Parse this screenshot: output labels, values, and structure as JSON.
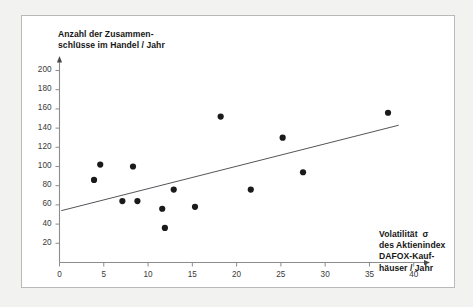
{
  "chart_data": {
    "type": "scatter",
    "title": "",
    "ylabel": "Anzahl der Zusammen-\nschlüsse im Handel / Jahr",
    "xlabel": "Volatilität  σ\ndes Aktienindex\nDAFOX-Kauf-\nhäuser / Jahr",
    "xlim": [
      0,
      41.5
    ],
    "ylim": [
      0,
      212
    ],
    "xticks": [
      0,
      5,
      10,
      15,
      20,
      25,
      30,
      35,
      40
    ],
    "yticks": [
      20,
      40,
      60,
      80,
      100,
      120,
      140,
      160,
      180,
      200
    ],
    "grid": false,
    "legend": null,
    "marker_color": "#1a1a1a",
    "axis_color": "#8c8c8c",
    "trendline_color": "#55555a",
    "points": [
      {
        "x": 3.9,
        "y": 86
      },
      {
        "x": 4.6,
        "y": 102
      },
      {
        "x": 7.1,
        "y": 64
      },
      {
        "x": 8.3,
        "y": 100
      },
      {
        "x": 8.8,
        "y": 64
      },
      {
        "x": 11.6,
        "y": 56
      },
      {
        "x": 11.9,
        "y": 36
      },
      {
        "x": 12.9,
        "y": 76
      },
      {
        "x": 15.3,
        "y": 58
      },
      {
        "x": 18.2,
        "y": 152
      },
      {
        "x": 21.6,
        "y": 76
      },
      {
        "x": 25.2,
        "y": 130
      },
      {
        "x": 27.5,
        "y": 94
      },
      {
        "x": 37.1,
        "y": 156
      }
    ],
    "trendline": {
      "x_start": 0.2,
      "y_start": 54,
      "x_end": 38.3,
      "y_end": 143
    }
  }
}
